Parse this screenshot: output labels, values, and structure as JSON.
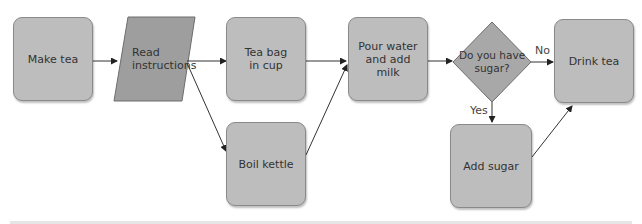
{
  "diagram": {
    "type": "flowchart",
    "nodes": {
      "make_tea": "Make tea",
      "read_instructions": "Read instructions",
      "tea_bag": "Tea bag in cup",
      "boil_kettle": "Boil kettle",
      "pour_water": "Pour water and add milk",
      "have_sugar": "Do you have sugar?",
      "add_sugar": "Add sugar",
      "drink_tea": "Drink tea"
    },
    "edge_labels": {
      "no": "No",
      "yes": "Yes"
    },
    "colors": {
      "process_fill": "#bdbdbd",
      "io_fill": "#9e9e9e",
      "decision_fill": "#a8a8a8",
      "stroke": "#555555"
    }
  }
}
